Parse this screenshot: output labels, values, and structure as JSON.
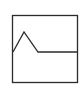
{
  "icon": {
    "name": "line-graph-icon",
    "stroke_color": "#2b2b2b",
    "background": "#ffffff",
    "frame": {
      "x": 12.5,
      "y": 15.5,
      "width": 65,
      "height": 67
    },
    "polyline": "13,52 24,32 38,52 78,52"
  }
}
